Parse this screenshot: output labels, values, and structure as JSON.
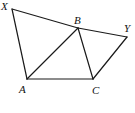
{
  "diagram": {
    "points": {
      "X": {
        "label": "X",
        "x": 12,
        "y": 9,
        "lx": 1,
        "ly": 10
      },
      "B": {
        "label": "B",
        "x": 78,
        "y": 28,
        "lx": 74,
        "ly": 24
      },
      "Y": {
        "label": "Y",
        "x": 127,
        "y": 37,
        "lx": 124,
        "ly": 32
      },
      "A": {
        "label": "A",
        "x": 27,
        "y": 79,
        "lx": 19,
        "ly": 93
      },
      "C": {
        "label": "C",
        "x": 93,
        "y": 79,
        "lx": 92,
        "ly": 94
      }
    },
    "segments": [
      "XB",
      "BY",
      "XA",
      "AB",
      "AC",
      "BC",
      "CY"
    ],
    "stroke_color": "#1a1a1a"
  }
}
